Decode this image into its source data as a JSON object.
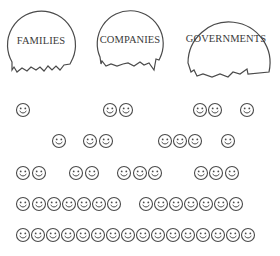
{
  "groups": [
    {
      "label": "FAMILIES",
      "cx": 41,
      "cy": 43,
      "r": 34,
      "label_y": 35
    },
    {
      "label": "COMPANIES",
      "cx": 130,
      "cy": 41,
      "r": 33,
      "label_y": 34
    },
    {
      "label": "GOVERNMENTS",
      "cx": 226,
      "cy": 48,
      "r": 41,
      "label_y": 33
    }
  ],
  "smiley_rows": [
    {
      "y": 110,
      "x": [
        23,
        110,
        126,
        200,
        215,
        247
      ]
    },
    {
      "y": 141,
      "x": [
        59,
        90,
        106,
        165,
        180,
        195,
        228
      ]
    },
    {
      "y": 173,
      "x": [
        23,
        39,
        76,
        92,
        124,
        140,
        155,
        201,
        216,
        232
      ]
    },
    {
      "y": 204,
      "x": [
        23,
        39,
        54,
        69,
        84,
        99,
        114,
        146,
        161,
        176,
        191,
        206,
        221,
        236
      ]
    },
    {
      "y": 235,
      "x": [
        23,
        38,
        53,
        68,
        83,
        98,
        113,
        128,
        143,
        158,
        173,
        188,
        203,
        218,
        233,
        248
      ]
    }
  ],
  "colors": {
    "stroke": "#4a4a4a",
    "text": "#3a3a3a",
    "background": "#ffffff"
  }
}
